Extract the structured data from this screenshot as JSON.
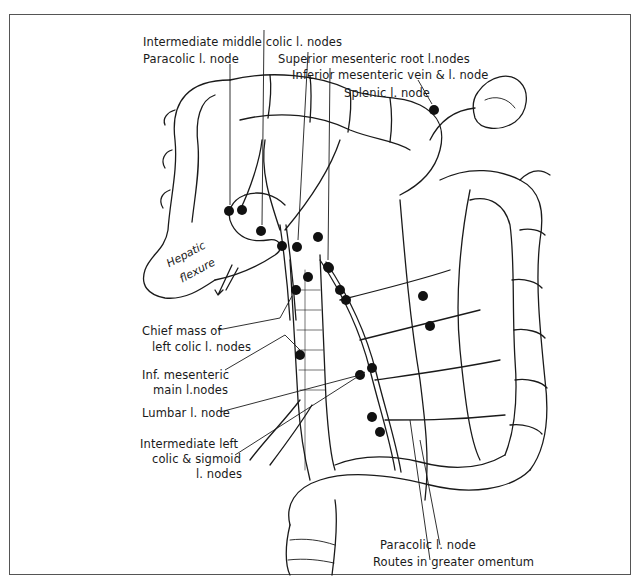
{
  "figure": {
    "labels": {
      "intermediate_middle_colic": "Intermediate middle colic l. nodes",
      "paracolic_top": "Paracolic l. node",
      "superior_mesenteric_root": "Superior mesenteric root l.nodes",
      "inferior_mesenteric_vein": "Inferior mesenteric vein & l. node",
      "splenic": "Splenic l. node",
      "hepatic_flexure_1": "Hepatic",
      "hepatic_flexure_2": "flexure",
      "chief_mass_1": "Chief mass of",
      "chief_mass_2": "left colic l. nodes",
      "inf_mesenteric_1": "Inf. mesenteric",
      "inf_mesenteric_2": "main l.nodes",
      "lumbar": "Lumbar l. node",
      "intermediate_left_1": "Intermediate left",
      "intermediate_left_2": "colic & sigmoid",
      "intermediate_left_3": "l. nodes",
      "paracolic_bottom": "Paracolic l. node",
      "routes_omentum": "Routes in greater omentum"
    },
    "colors": {
      "ink": "#1a1a1a",
      "frame": "#555555",
      "background": "#ffffff"
    }
  }
}
